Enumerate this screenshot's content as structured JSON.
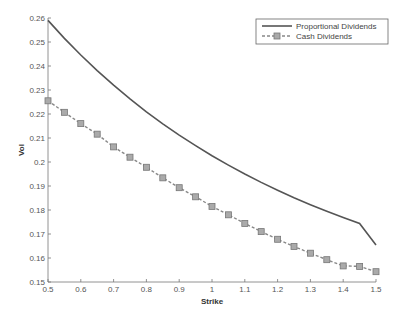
{
  "chart_data": {
    "type": "line",
    "title": "",
    "xlabel": "Strike",
    "ylabel": "Vol",
    "xlim": [
      0.5,
      1.5
    ],
    "ylim": [
      0.15,
      0.26
    ],
    "grid": false,
    "legend_position": "upper right",
    "x_ticks": [
      "0.5",
      "0.6",
      "0.7",
      "0.8",
      "0.9",
      "1",
      "1.1",
      "1.2",
      "1.3",
      "1.4",
      "1.5"
    ],
    "y_ticks": [
      "0.15",
      "0.16",
      "0.17",
      "0.18",
      "0.19",
      "0.2",
      "0.21",
      "0.22",
      "0.23",
      "0.24",
      "0.25",
      "0.26"
    ],
    "x": [
      0.5,
      0.55,
      0.6,
      0.65,
      0.7,
      0.75,
      0.8,
      0.85,
      0.9,
      0.95,
      1.0,
      1.05,
      1.1,
      1.15,
      1.2,
      1.25,
      1.3,
      1.35,
      1.4,
      1.45,
      1.5
    ],
    "series": [
      {
        "name": "Proportional Dividends",
        "style": "solid",
        "color": "#555555",
        "values": [
          0.259,
          0.2515,
          0.2446,
          0.2381,
          0.232,
          0.2263,
          0.2209,
          0.2159,
          0.2112,
          0.2068,
          0.2026,
          0.1987,
          0.195,
          0.1915,
          0.1882,
          0.1851,
          0.1822,
          0.1795,
          0.1769,
          0.1744,
          0.1654
        ]
      },
      {
        "name": "Cash Dividends",
        "style": "dashed-square-markers",
        "color": "#888888",
        "values": [
          0.2255,
          0.2207,
          0.216,
          0.2116,
          0.2063,
          0.202,
          0.1978,
          0.1934,
          0.1893,
          0.1855,
          0.1815,
          0.178,
          0.1744,
          0.171,
          0.1678,
          0.1648,
          0.162,
          0.1593,
          0.1567,
          0.1565,
          0.1543
        ]
      }
    ]
  },
  "legend": {
    "items": [
      "Proportional Dividends",
      "Cash Dividends"
    ]
  }
}
